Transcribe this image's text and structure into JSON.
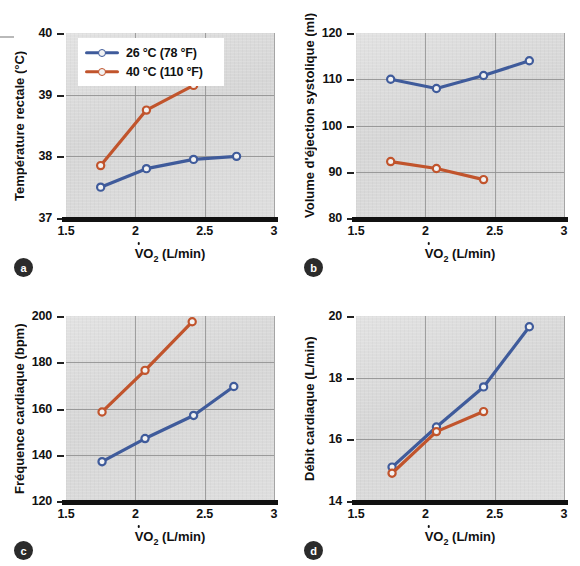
{
  "figure": {
    "legend": {
      "series": [
        {
          "label": "26 °C (78 °F)",
          "color": "#3f5b9b",
          "name": "cool"
        },
        {
          "label": "40 °C (110 °F)",
          "color": "#c1542c",
          "name": "hot"
        }
      ]
    },
    "xaxis_title_prefix": "V",
    "xaxis_title_suffix": "O",
    "xaxis_title_sub": "2",
    "xaxis_title_unit": " (L/min)",
    "panels": [
      {
        "badge": "a",
        "ytitle": "Température rectale (°C)"
      },
      {
        "badge": "b",
        "ytitle": "Volume d'éjection systolique (ml)"
      },
      {
        "badge": "c",
        "ytitle": "Fréquence cardiaque (bpm)"
      },
      {
        "badge": "d",
        "ytitle": "Débit cardiaque (L/min)"
      }
    ]
  },
  "chart_data": [
    {
      "panel": "a",
      "type": "line",
      "title": "Température rectale vs VO2",
      "xlabel": "VO2 (L/min)",
      "ylabel": "Température rectale (°C)",
      "xlim": [
        1.5,
        3
      ],
      "ylim": [
        37,
        40
      ],
      "xticks": [
        1.5,
        2,
        2.5,
        3
      ],
      "xtick_labels": [
        "1.5",
        "2",
        "2.5",
        "3"
      ],
      "yticks": [
        37,
        38,
        39,
        40
      ],
      "ytick_labels": [
        "37",
        "38",
        "39",
        "40"
      ],
      "grid": true,
      "legend_position": "upper-left",
      "series": [
        {
          "name": "26 °C (78 °F)",
          "color": "#3f5b9b",
          "x": [
            1.75,
            2.08,
            2.42,
            2.73
          ],
          "values": [
            37.5,
            37.8,
            37.95,
            38.0
          ]
        },
        {
          "name": "40 °C (110 °F)",
          "color": "#c1542c",
          "x": [
            1.75,
            2.08,
            2.42
          ],
          "values": [
            37.85,
            38.75,
            39.15
          ]
        }
      ]
    },
    {
      "panel": "b",
      "type": "line",
      "title": "Volume d'éjection systolique vs VO2",
      "xlabel": "VO2 (L/min)",
      "ylabel": "Volume d'éjection systolique (ml)",
      "xlim": [
        1.5,
        3
      ],
      "ylim": [
        80,
        120
      ],
      "xticks": [
        1.5,
        2,
        2.5,
        3
      ],
      "xtick_labels": [
        "1.5",
        "2",
        "2.5",
        "3"
      ],
      "yticks": [
        80,
        90,
        100,
        110,
        120
      ],
      "ytick_labels": [
        "80",
        "90",
        "100",
        "110",
        "120"
      ],
      "grid": true,
      "legend_position": "none",
      "series": [
        {
          "name": "26 °C (78 °F)",
          "color": "#3f5b9b",
          "x": [
            1.75,
            2.08,
            2.42,
            2.75
          ],
          "values": [
            110.0,
            108.0,
            110.8,
            114.0
          ]
        },
        {
          "name": "40 °C (110 °F)",
          "color": "#c1542c",
          "x": [
            1.75,
            2.08,
            2.42
          ],
          "values": [
            92.2,
            90.7,
            88.3
          ]
        }
      ]
    },
    {
      "panel": "c",
      "type": "line",
      "title": "Fréquence cardiaque vs VO2",
      "xlabel": "VO2 (L/min)",
      "ylabel": "Fréquence cardiaque (bpm)",
      "xlim": [
        1.5,
        3
      ],
      "ylim": [
        120,
        200
      ],
      "xticks": [
        1.5,
        2,
        2.5,
        3
      ],
      "xtick_labels": [
        "1.5",
        "2",
        "2.5",
        "3"
      ],
      "yticks": [
        120,
        140,
        160,
        180,
        200
      ],
      "ytick_labels": [
        "120",
        "140",
        "160",
        "180",
        "200"
      ],
      "grid": true,
      "legend_position": "none",
      "series": [
        {
          "name": "26 °C (78 °F)",
          "color": "#3f5b9b",
          "x": [
            1.76,
            2.07,
            2.42,
            2.71
          ],
          "values": [
            137.0,
            147.0,
            157.0,
            169.5
          ]
        },
        {
          "name": "40 °C (110 °F)",
          "color": "#c1542c",
          "x": [
            1.76,
            2.07,
            2.41
          ],
          "values": [
            158.5,
            176.5,
            197.5
          ]
        }
      ]
    },
    {
      "panel": "d",
      "type": "line",
      "title": "Débit cardiaque vs VO2",
      "xlabel": "VO2 (L/min)",
      "ylabel": "Débit cardiaque (L/min)",
      "xlim": [
        1.5,
        3
      ],
      "ylim": [
        14,
        20
      ],
      "xticks": [
        1.5,
        2,
        2.5,
        3
      ],
      "xtick_labels": [
        "1.5",
        "2",
        "2.5",
        "3"
      ],
      "yticks": [
        14,
        16,
        18,
        20
      ],
      "ytick_labels": [
        "14",
        "16",
        "18",
        "20"
      ],
      "grid": true,
      "legend_position": "none",
      "series": [
        {
          "name": "26 °C (78 °F)",
          "color": "#3f5b9b",
          "x": [
            1.76,
            2.08,
            2.42,
            2.75
          ],
          "values": [
            15.1,
            16.4,
            17.7,
            19.65
          ]
        },
        {
          "name": "40 °C (110 °F)",
          "color": "#c1542c",
          "x": [
            1.76,
            2.08,
            2.42
          ],
          "values": [
            14.9,
            16.25,
            16.9
          ]
        }
      ]
    }
  ]
}
